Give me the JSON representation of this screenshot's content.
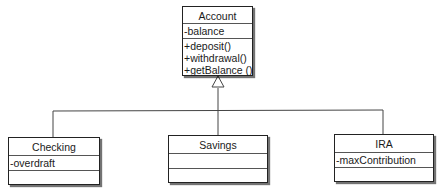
{
  "diagram": {
    "type": "uml-class-inheritance",
    "classes": {
      "account": {
        "name": "Account",
        "attributes": [
          "-balance"
        ],
        "operations": [
          "+deposit()",
          "+withdrawal()",
          "+getBalance ()"
        ]
      },
      "checking": {
        "name": "Checking",
        "attributes": [
          "-overdraft"
        ],
        "operations": []
      },
      "savings": {
        "name": "Savings",
        "attributes": [],
        "operations": []
      },
      "ira": {
        "name": "IRA",
        "attributes": [
          "-maxContribution"
        ],
        "operations": []
      }
    },
    "relationships": [
      {
        "type": "generalization",
        "from": "Checking",
        "to": "Account"
      },
      {
        "type": "generalization",
        "from": "Savings",
        "to": "Account"
      },
      {
        "type": "generalization",
        "from": "IRA",
        "to": "Account"
      }
    ],
    "colors": {
      "line": "#444444",
      "border": "#222222",
      "background": "#ffffff"
    }
  }
}
